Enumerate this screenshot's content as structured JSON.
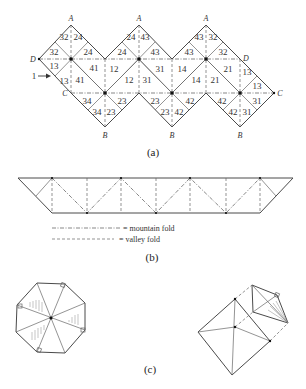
{
  "figure_a": {
    "caption": "(a)",
    "vertex_labels": {
      "A1": "A",
      "A2": "A",
      "A3": "A",
      "D_left": "D",
      "D_right": "D",
      "C_left": "C",
      "C_right": "C",
      "B1": "B",
      "B2": "B",
      "B3": "B"
    },
    "arrow_label": "1",
    "face_numbers": [
      "32",
      "24",
      "32",
      "24",
      "13",
      "13",
      "41",
      "41",
      "34",
      "34",
      "23",
      "12",
      "12",
      "23",
      "24",
      "43",
      "24",
      "43",
      "31",
      "31",
      "23",
      "23",
      "14",
      "14",
      "42",
      "42",
      "43",
      "32",
      "43",
      "32",
      "21",
      "21",
      "42",
      "42",
      "13",
      "13",
      "31",
      "31"
    ]
  },
  "figure_b": {
    "caption": "(b)",
    "legend": {
      "mountain": "= mountain fold",
      "valley": "= valley fold"
    }
  },
  "figure_c": {
    "caption": "(c)"
  }
}
